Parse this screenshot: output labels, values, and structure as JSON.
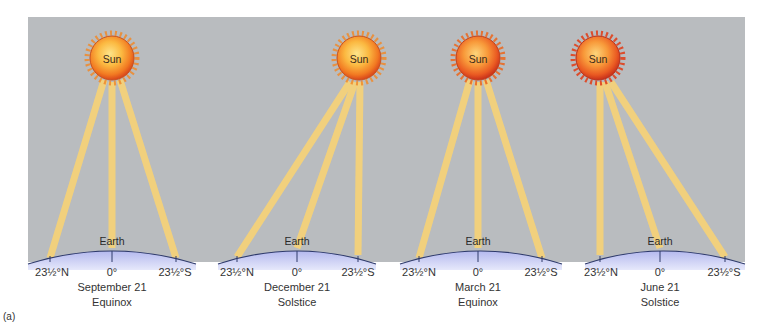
{
  "figure": {
    "caption_label": "(a)",
    "sun_label": "Sun",
    "earth_label": "Earth",
    "colors": {
      "sky": "#b9bcbf",
      "beam": "#f5d27a",
      "earth_fill": "#c9cdf2",
      "earth_edge": "#2e3a6b",
      "sun_core": "#fbd35a",
      "sun_rim": "#e8501c"
    },
    "panels": [
      {
        "id": "september",
        "date": "September 21",
        "event": "Equinox",
        "lat_north": "23½°N",
        "lat_equator": "0°",
        "lat_south": "23½°S",
        "direct_ray_latitude": "0°"
      },
      {
        "id": "december",
        "date": "December 21",
        "event": "Solstice",
        "lat_north": "23½°N",
        "lat_equator": "0°",
        "lat_south": "23½°S",
        "direct_ray_latitude": "23½°S"
      },
      {
        "id": "march",
        "date": "March 21",
        "event": "Equinox",
        "lat_north": "23½°N",
        "lat_equator": "0°",
        "lat_south": "23½°S",
        "direct_ray_latitude": "0°"
      },
      {
        "id": "june",
        "date": "June 21",
        "event": "Solstice",
        "lat_north": "23½°N",
        "lat_equator": "0°",
        "lat_south": "23½°S",
        "direct_ray_latitude": "23½°N"
      }
    ]
  }
}
